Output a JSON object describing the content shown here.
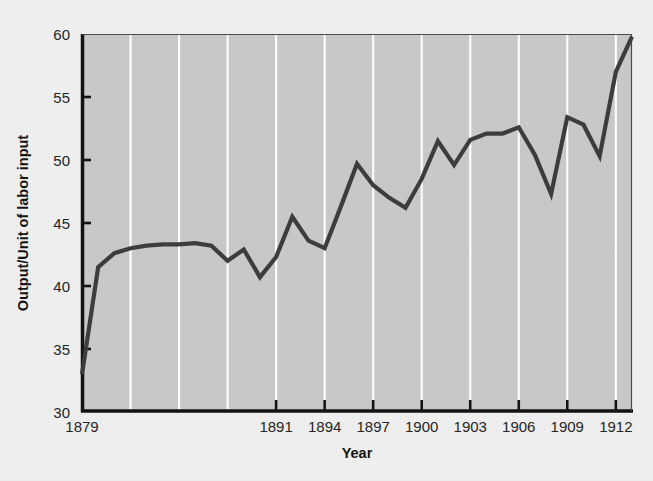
{
  "chart_data": {
    "type": "line",
    "title": "",
    "subtitle": "",
    "xlabel": "Year",
    "ylabel": "Output/Unit of labor input",
    "xlim": [
      1879,
      1913
    ],
    "ylim": [
      30,
      60
    ],
    "grid": "vertical-white-gridlines",
    "legend": "none",
    "plot_background_color": "#c9c9c9",
    "page_background_color": "#f1f1f1",
    "line_color": "#3b3b3b",
    "axis_color": "#101010",
    "gridline_color": "#ffffff",
    "y_ticks": [
      30,
      35,
      40,
      45,
      50,
      55,
      60
    ],
    "y_tick_labels": [
      "30",
      "35",
      "40",
      "45",
      "50",
      "55",
      "60"
    ],
    "x_ticks": [
      1879,
      1891,
      1894,
      1897,
      1900,
      1903,
      1906,
      1909,
      1912
    ],
    "x_tick_labels": [
      "1879",
      "1891",
      "1894",
      "1897",
      "1900",
      "1903",
      "1906",
      "1909",
      "1912"
    ],
    "x_gridlines": [
      1882,
      1885,
      1888,
      1891,
      1894,
      1897,
      1900,
      1903,
      1906,
      1909,
      1912
    ],
    "x": [
      1879,
      1880,
      1881,
      1882,
      1883,
      1884,
      1885,
      1886,
      1887,
      1888,
      1889,
      1890,
      1891,
      1892,
      1893,
      1894,
      1895,
      1896,
      1897,
      1898,
      1899,
      1900,
      1901,
      1902,
      1903,
      1904,
      1905,
      1906,
      1907,
      1908,
      1909,
      1910,
      1911,
      1912,
      1913
    ],
    "values": [
      33.0,
      41.5,
      42.6,
      43.0,
      43.2,
      43.3,
      43.3,
      43.4,
      43.2,
      42.0,
      42.9,
      40.7,
      42.3,
      45.5,
      43.6,
      43.0,
      46.3,
      49.7,
      48.0,
      47.0,
      46.2,
      48.5,
      51.5,
      49.6,
      51.6,
      52.1,
      52.1,
      52.6,
      50.4,
      47.3,
      53.4,
      52.8,
      50.3,
      57.0,
      59.8
    ],
    "series": [
      {
        "name": "Output per unit of labor input",
        "values": [
          33.0,
          41.5,
          42.6,
          43.0,
          43.2,
          43.3,
          43.3,
          43.4,
          43.2,
          42.0,
          42.9,
          40.7,
          42.3,
          45.5,
          43.6,
          43.0,
          46.3,
          49.7,
          48.0,
          47.0,
          46.2,
          48.5,
          51.5,
          49.6,
          51.6,
          52.1,
          52.1,
          52.6,
          50.4,
          47.3,
          53.4,
          52.8,
          50.3,
          57.0,
          59.8
        ]
      }
    ]
  }
}
